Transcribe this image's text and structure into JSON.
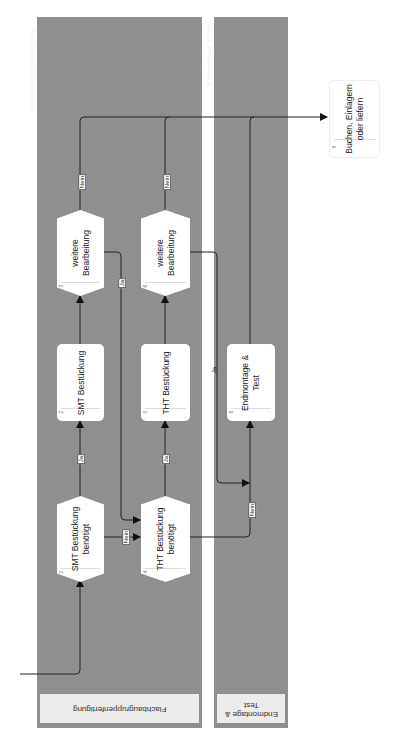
{
  "diagram": {
    "type": "swimlane-flowchart",
    "orientation": "rotated-90-ccw",
    "colors": {
      "lane_bg": "#8f8f8f",
      "lane_header_bg": "#ececec",
      "node_bg": "#ffffff",
      "edge": "#222222"
    },
    "lanes": [
      {
        "id": "lane-1",
        "title": "Flachbaugruppenfertigung",
        "header": "Flachbaugruppenfertigung"
      },
      {
        "id": "lane-2",
        "title": "Endmontage & Test",
        "header": "Endmontage &\nTest"
      }
    ],
    "nodes": [
      {
        "id": "1",
        "number": "1",
        "label": "SMT Bestückung\nbenötigt",
        "shape": "decision",
        "lane": "lane-1"
      },
      {
        "id": "2",
        "number": "2",
        "label": "SMT Bestückung",
        "shape": "process",
        "lane": "lane-1"
      },
      {
        "id": "3",
        "number": "3",
        "label": "weitere\nBearbeitung",
        "shape": "decision",
        "lane": "lane-1"
      },
      {
        "id": "4",
        "number": "4",
        "label": "THT Bestückung\nbenötigt",
        "shape": "decision",
        "lane": "lane-1"
      },
      {
        "id": "5",
        "number": "5",
        "label": "THT Bestückung",
        "shape": "process",
        "lane": "lane-1"
      },
      {
        "id": "6",
        "number": "6",
        "label": "weitere\nBearbeitung",
        "shape": "decision",
        "lane": "lane-1"
      },
      {
        "id": "8",
        "number": "8",
        "label": "Endmontage &\nTest",
        "shape": "process",
        "lane": "lane-2"
      },
      {
        "id": "9",
        "number": "9",
        "label": "Buchen, Einlagern\noder liefern",
        "shape": "process",
        "lane": "outside"
      }
    ],
    "edges": [
      {
        "from": "start",
        "to": "1",
        "label": ""
      },
      {
        "from": "1",
        "to": "2",
        "label": "Ja"
      },
      {
        "from": "1",
        "to": "4",
        "label": "Nein"
      },
      {
        "from": "2",
        "to": "3",
        "label": ""
      },
      {
        "from": "3",
        "to": "9",
        "label": "Nein"
      },
      {
        "from": "3",
        "to": "4",
        "label": "Ja"
      },
      {
        "from": "4",
        "to": "5",
        "label": "Ja"
      },
      {
        "from": "4",
        "to": "8",
        "label": "Nein"
      },
      {
        "from": "5",
        "to": "6",
        "label": ""
      },
      {
        "from": "6",
        "to": "9",
        "label": "Nein"
      },
      {
        "from": "6",
        "to": "8",
        "label": "Ja"
      },
      {
        "from": "8",
        "to": "9",
        "label": ""
      }
    ],
    "edge_labels": {
      "ja": "Ja",
      "nein": "Nein"
    }
  }
}
